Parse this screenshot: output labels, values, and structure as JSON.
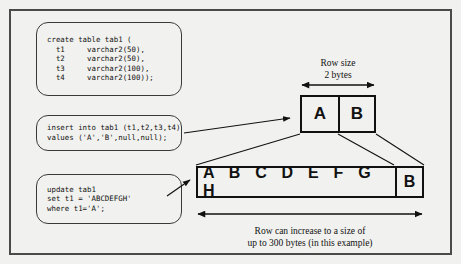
{
  "diagram": {
    "title_visible": false,
    "background_color": "#f1f1ef",
    "frame_color": "#4a4a4a",
    "ink_color": "#111111"
  },
  "code_blocks": [
    {
      "id": "create",
      "name": "create-table-statement",
      "text": "create table tab1 (\n  t1     varchar2(50),\n  t2     varchar2(50),\n  t3     varchar2(100),\n  t4     varchar2(100));"
    },
    {
      "id": "insert",
      "name": "insert-statement",
      "text": "insert into tab1 (t1,t2,t3,t4)\nvalues ('A','B',null,null);"
    },
    {
      "id": "update",
      "name": "update-statement",
      "text": "update tab1\nset t1 = 'ABCDEFGH'\nwhere t1='A';"
    }
  ],
  "small_row": {
    "label": "Row size\n2 bytes",
    "cells": [
      {
        "value": "A"
      },
      {
        "value": "B"
      }
    ]
  },
  "wide_row": {
    "caption": "Row can increase to a size of\nup to 300 bytes (in this example)",
    "cells": [
      {
        "value": "A B C D E F G H"
      },
      {
        "value": "B"
      }
    ]
  }
}
